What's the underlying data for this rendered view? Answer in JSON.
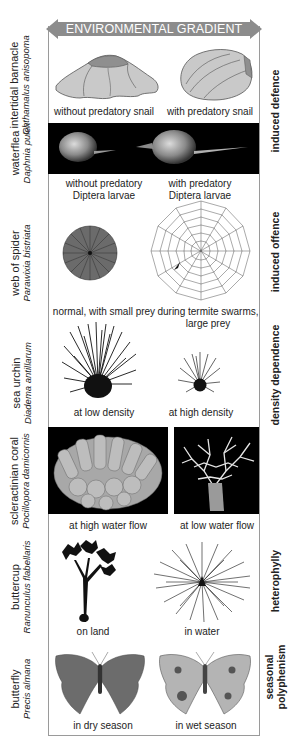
{
  "header": {
    "arrow_label": "ENVIRONMENTAL GRADIENT",
    "arrow_color": "#8c8c8c"
  },
  "rows": [
    {
      "id": "barnacle",
      "common_name": "intertidal barnacle",
      "scientific_name": "Chthamalus anisopoma",
      "left_caption": "without predatory snail",
      "right_caption": "with predatory snail"
    },
    {
      "id": "waterflea",
      "common_name": "waterflea",
      "scientific_name": "Daphnia pulex",
      "left_caption_line1": "without predatory",
      "left_caption_line2": "Diptera larvae",
      "right_caption_line1": "with predatory",
      "right_caption_line2": "Diptera larvae"
    },
    {
      "id": "spider",
      "common_name": "web of spider",
      "scientific_name": "Parawixia bistriata",
      "left_caption": "normal, with small prey",
      "right_caption_line1": "during termite swarms,",
      "right_caption_line2": "large prey"
    },
    {
      "id": "urchin",
      "common_name": "sea urchin",
      "scientific_name": "Diadema antillarum",
      "left_caption": "at low density",
      "right_caption": "at high density"
    },
    {
      "id": "coral",
      "common_name": "scleractinian coral",
      "scientific_name": "Pocillopora damicornis",
      "left_caption": "at high water flow",
      "right_caption": "at low water flow"
    },
    {
      "id": "buttercup",
      "common_name": "buttercup",
      "scientific_name": "Ranunculus flabellaris",
      "left_caption": "on land",
      "right_caption": "in water"
    },
    {
      "id": "butterfly",
      "common_name": "butterfly",
      "scientific_name": "Precis almana",
      "left_caption": "in dry season",
      "right_caption": "in wet season"
    }
  ],
  "categories": {
    "induced_defence": "induced defence",
    "induced_offence": "induced offence",
    "density_dependence": "density dependence",
    "heterophylly": "heterophylly",
    "seasonal_line1": "seasonal",
    "seasonal_line2": "polyphenism"
  }
}
